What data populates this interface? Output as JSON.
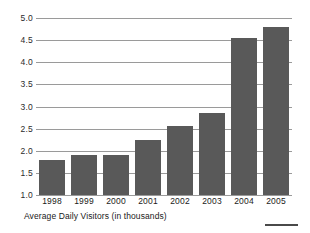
{
  "chart_data": {
    "type": "bar",
    "title": "",
    "subtitle": "",
    "caption": "Average Daily Visitors (in thousands)",
    "xlabel": "",
    "ylabel": "",
    "categories": [
      "1998",
      "1999",
      "2000",
      "2001",
      "2002",
      "2003",
      "2004",
      "2005"
    ],
    "values": [
      1.8,
      1.9,
      1.9,
      2.25,
      2.55,
      2.85,
      4.55,
      4.8
    ],
    "series": [
      {
        "name": "Average Daily Visitors (in thousands)",
        "values": [
          1.8,
          1.9,
          1.9,
          2.25,
          2.55,
          2.85,
          4.55,
          4.8
        ]
      }
    ],
    "ylim": [
      1.0,
      5.0
    ],
    "ytick_values": [
      1.0,
      1.5,
      2.0,
      2.5,
      3.0,
      3.5,
      4.0,
      4.5,
      5.0
    ],
    "ytick_labels": [
      "1.0",
      "1.5",
      "2.0",
      "2.5",
      "3.0",
      "3.5",
      "4.0",
      "4.5",
      "5.0"
    ],
    "grid": true,
    "grid_orientation": "horizontal",
    "legend": false,
    "legend_position": "none",
    "bar_color": "#595959",
    "gridline_color": "#9a9a9a",
    "background_color": "#ffffff",
    "text_color": "#1a1a1a"
  },
  "footer": {
    "rule_color": "#4a4a4a"
  }
}
